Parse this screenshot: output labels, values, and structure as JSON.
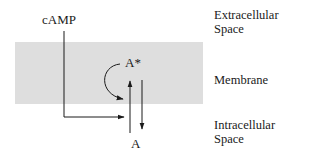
{
  "diagram": {
    "regions": [
      {
        "id": "extracellular",
        "label_line1": "Extracellular",
        "label_line2": "Space"
      },
      {
        "id": "membrane",
        "label": "Membrane"
      },
      {
        "id": "intracellular",
        "label_line1": "Intracellular",
        "label_line2": "Space"
      }
    ],
    "nodes": {
      "camp": "cAMP",
      "a_star": "A*",
      "a": "A"
    },
    "colors": {
      "membrane": "#dedede",
      "line": "#1a1a1a",
      "background": "#ffffff"
    },
    "edges": [
      {
        "from": "cAMP",
        "to": "A-activation",
        "type": "elbow-arrow"
      },
      {
        "from": "A*",
        "to": "A-activation",
        "type": "curved-arrow"
      },
      {
        "from": "A",
        "to": "A*",
        "type": "arrow-up"
      },
      {
        "from": "A*",
        "to": "A",
        "type": "arrow-down"
      }
    ]
  }
}
